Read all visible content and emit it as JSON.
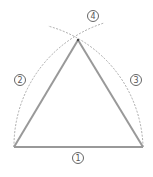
{
  "diagram": {
    "colors": {
      "triangle": "#999999",
      "arc": "#888888",
      "label": "#555555",
      "background": "#ffffff"
    },
    "points": {
      "A": [
        14,
        147
      ],
      "B": [
        143,
        147
      ],
      "C": [
        78,
        40
      ]
    },
    "steps": [
      {
        "id": "1",
        "label": "①",
        "desc": "base segment",
        "pos": [
          78,
          158
        ]
      },
      {
        "id": "2",
        "label": "②",
        "desc": "arc from left endpoint",
        "pos": [
          20,
          80
        ]
      },
      {
        "id": "3",
        "label": "③",
        "desc": "arc from right endpoint",
        "pos": [
          136,
          80
        ]
      },
      {
        "id": "4",
        "label": "④",
        "desc": "intersection of arcs (apex)",
        "pos": [
          93,
          16
        ]
      }
    ]
  }
}
